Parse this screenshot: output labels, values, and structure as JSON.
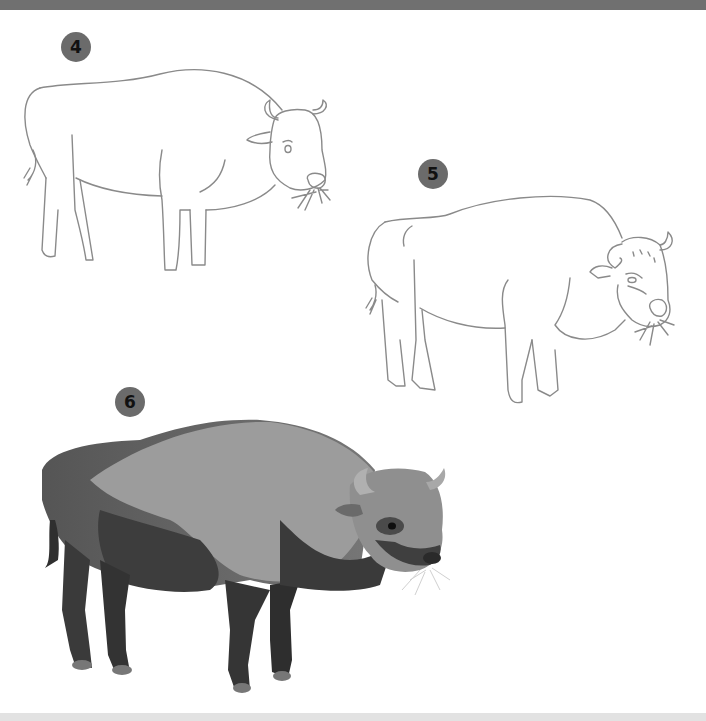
{
  "page": {
    "top_bar_color": "#707070",
    "bottom_bar_color": "#e2e2e2"
  },
  "steps": [
    {
      "number": "4",
      "description": "Outline drawing of bison with head, horns, ear, eye and grass in mouth",
      "badge_color": "#6b6b6b"
    },
    {
      "number": "5",
      "description": "Refined outline drawing with fur details on chest, legs and face",
      "badge_color": "#6b6b6b"
    },
    {
      "number": "6",
      "description": "Fully shaded grayscale illustration of bison eating grass",
      "badge_color": "#6b6b6b"
    }
  ]
}
